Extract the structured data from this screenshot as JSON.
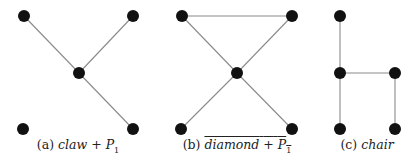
{
  "figures": [
    {
      "id": "a",
      "caption": {
        "label": "(a)",
        "name": "claw",
        "plus": "+",
        "p": "P",
        "sub": "1",
        "overline": false
      },
      "caption_x": 78,
      "nodes": [
        [
          24,
          16
        ],
        [
          133,
          16
        ],
        [
          79,
          73
        ],
        [
          23,
          129
        ],
        [
          133,
          129
        ]
      ],
      "edges": [
        [
          0,
          2
        ],
        [
          1,
          2
        ],
        [
          2,
          4
        ]
      ]
    },
    {
      "id": "b",
      "caption": {
        "label": "(b)",
        "name": "diamond",
        "plus": "+",
        "p": "P",
        "sub": "1",
        "overline": true
      },
      "caption_x": 237,
      "nodes": [
        [
          182,
          16
        ],
        [
          292,
          16
        ],
        [
          237,
          73
        ],
        [
          181,
          129
        ],
        [
          292,
          129
        ]
      ],
      "edges": [
        [
          0,
          1
        ],
        [
          0,
          2
        ],
        [
          1,
          2
        ],
        [
          2,
          3
        ],
        [
          2,
          4
        ]
      ]
    },
    {
      "id": "c",
      "caption": {
        "label": "(c)",
        "name": "chair"
      },
      "caption_x": 367,
      "nodes": [
        [
          340,
          16
        ],
        [
          340,
          73
        ],
        [
          395,
          73
        ],
        [
          340,
          129
        ],
        [
          395,
          129
        ]
      ],
      "edges": [
        [
          0,
          1
        ],
        [
          1,
          2
        ],
        [
          1,
          3
        ],
        [
          2,
          4
        ]
      ]
    }
  ],
  "colors": {
    "node": "#111111",
    "edge": "#8a8a8a"
  },
  "node_radius": 6
}
